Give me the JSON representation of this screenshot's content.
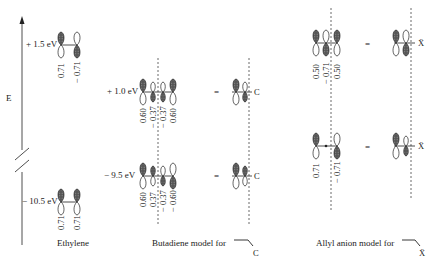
{
  "axis": {
    "label": "E",
    "break": true
  },
  "ethylene": {
    "caption": "Ethylene",
    "levels": [
      {
        "energy": "+ 1.5 eV",
        "coefficients": [
          "0.71",
          "− 0.71"
        ],
        "phases": [
          "up",
          "down"
        ]
      },
      {
        "energy": "− 10.5 eV",
        "coefficients": [
          "0.71",
          "0.71"
        ],
        "phases": [
          "up",
          "up"
        ]
      }
    ]
  },
  "butadiene": {
    "caption": "Butadiene model for",
    "model_atom": "C",
    "equals": "=",
    "levels": [
      {
        "energy": "+ 1.0 eV",
        "coefficients": [
          "0.60",
          "− 0.37",
          "− 0.37",
          "0.60"
        ],
        "phases": [
          "up",
          "down",
          "down",
          "up"
        ]
      },
      {
        "energy": "− 9.5 eV",
        "coefficients": [
          "0.60",
          "0.37",
          "− 0.37",
          "− 0.60"
        ],
        "phases": [
          "up",
          "up",
          "down",
          "down"
        ]
      }
    ]
  },
  "allyl": {
    "caption": "Allyl anion model for",
    "model_atom": "Ẍ",
    "equals": "=",
    "levels": [
      {
        "coefficients": [
          "0.50",
          "− 0.71",
          "0.50"
        ],
        "phases": [
          "up",
          "down",
          "up"
        ]
      },
      {
        "coefficients": [
          "0.71",
          "0",
          "− 0.71"
        ],
        "phases": [
          "up",
          "node",
          "down"
        ]
      }
    ]
  }
}
